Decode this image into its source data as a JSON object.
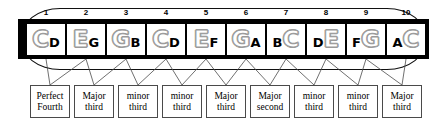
{
  "diagram": {
    "instrument": "10-hole diatonic harmonica in C",
    "colors": {
      "body": "#000000",
      "hole": "#ffffff",
      "blow_note": "#9a9a9a",
      "draw_note": "#000000",
      "line": "#4a4a4a"
    }
  },
  "holes": [
    {
      "number": "1",
      "blow": "C",
      "draw": "D",
      "order": "blow-first"
    },
    {
      "number": "2",
      "blow": "E",
      "draw": "G",
      "order": "blow-first"
    },
    {
      "number": "3",
      "blow": "G",
      "draw": "B",
      "order": "blow-first"
    },
    {
      "number": "4",
      "blow": "C",
      "draw": "D",
      "order": "blow-first"
    },
    {
      "number": "5",
      "blow": "E",
      "draw": "F",
      "order": "blow-first"
    },
    {
      "number": "6",
      "blow": "G",
      "draw": "A",
      "order": "blow-first"
    },
    {
      "number": "7",
      "blow": "C",
      "draw": "B",
      "order": "draw-first"
    },
    {
      "number": "8",
      "blow": "E",
      "draw": "D",
      "order": "draw-first"
    },
    {
      "number": "9",
      "blow": "G",
      "draw": "F",
      "order": "draw-first"
    },
    {
      "number": "10",
      "blow": "C",
      "draw": "A",
      "order": "draw-first"
    }
  ],
  "intervals": [
    {
      "line1": "Perfect",
      "line2": "Fourth"
    },
    {
      "line1": "Major",
      "line2": "third"
    },
    {
      "line1": "minor",
      "line2": "third"
    },
    {
      "line1": "minor",
      "line2": "third"
    },
    {
      "line1": "Major",
      "line2": "third"
    },
    {
      "line1": "Major",
      "line2": "second"
    },
    {
      "line1": "minor",
      "line2": "third"
    },
    {
      "line1": "minor",
      "line2": "third"
    },
    {
      "line1": "Major",
      "line2": "third"
    }
  ]
}
